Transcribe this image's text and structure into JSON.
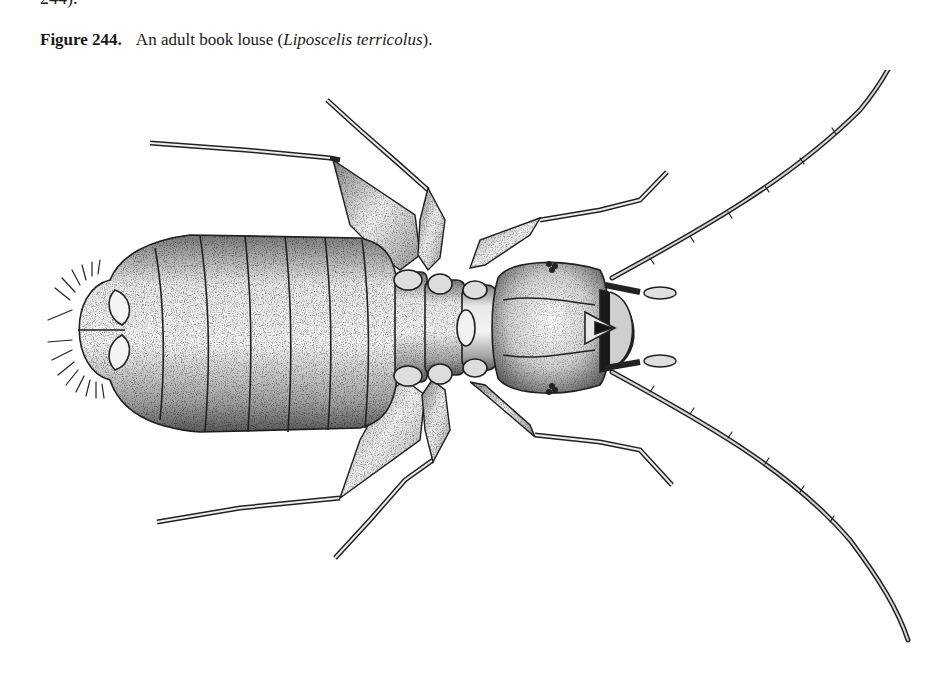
{
  "page": {
    "top_fragment": "244).",
    "caption": {
      "label": "Figure 244.",
      "text_before": "An adult book louse (",
      "species": "Liposcelis terricolus",
      "text_after": ")."
    },
    "figure": {
      "subject": "adult book louse",
      "style": "stippled pen-and-ink scientific illustration",
      "view": "dorsal",
      "parts": [
        "antenna-left",
        "antenna-right",
        "head",
        "thorax",
        "abdomen",
        "leg-1-left",
        "leg-2-left",
        "leg-3-left",
        "leg-1-right",
        "leg-2-right",
        "leg-3-right",
        "abdominal-setae",
        "compound-eye-left",
        "compound-eye-right",
        "mouthparts",
        "maxillary-palp-left",
        "maxillary-palp-right"
      ]
    }
  }
}
